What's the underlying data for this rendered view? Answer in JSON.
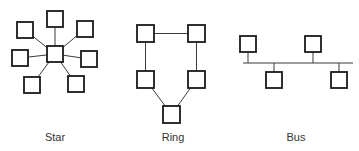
{
  "diagram": {
    "type": "network-topologies",
    "colors": {
      "stroke": "#1a1a1a",
      "line": "#3a3a3a",
      "background": "#ffffff",
      "text": "#333333"
    },
    "topologies": [
      {
        "id": "star",
        "label": "Star",
        "label_pos": [
          55,
          141
        ],
        "hub": {
          "x": 47,
          "y": 46,
          "w": 16,
          "h": 16
        },
        "nodes": [
          {
            "x": 47,
            "y": 11,
            "w": 16,
            "h": 16
          },
          {
            "x": 77,
            "y": 21,
            "w": 16,
            "h": 16
          },
          {
            "x": 81,
            "y": 51,
            "w": 16,
            "h": 16
          },
          {
            "x": 68,
            "y": 76,
            "w": 16,
            "h": 16
          },
          {
            "x": 24,
            "y": 77,
            "w": 16,
            "h": 16
          },
          {
            "x": 12,
            "y": 50,
            "w": 16,
            "h": 16
          },
          {
            "x": 17,
            "y": 22,
            "w": 16,
            "h": 16
          }
        ]
      },
      {
        "id": "ring",
        "label": "Ring",
        "label_pos": [
          173,
          141
        ],
        "nodes": [
          {
            "x": 137,
            "y": 25,
            "w": 17,
            "h": 17
          },
          {
            "x": 188,
            "y": 25,
            "w": 17,
            "h": 17
          },
          {
            "x": 188,
            "y": 71,
            "w": 17,
            "h": 17
          },
          {
            "x": 163,
            "y": 106,
            "w": 17,
            "h": 17
          },
          {
            "x": 137,
            "y": 71,
            "w": 17,
            "h": 17
          }
        ]
      },
      {
        "id": "bus",
        "label": "Bus",
        "label_pos": [
          296,
          141
        ],
        "bus_line": {
          "x1": 243,
          "x2": 353,
          "y": 63
        },
        "nodes": [
          {
            "x": 240,
            "y": 36,
            "w": 16,
            "h": 16,
            "side": "top"
          },
          {
            "x": 266,
            "y": 72,
            "w": 16,
            "h": 16,
            "side": "bottom"
          },
          {
            "x": 305,
            "y": 36,
            "w": 16,
            "h": 16,
            "side": "top"
          },
          {
            "x": 331,
            "y": 72,
            "w": 16,
            "h": 16,
            "side": "bottom"
          }
        ]
      }
    ]
  }
}
